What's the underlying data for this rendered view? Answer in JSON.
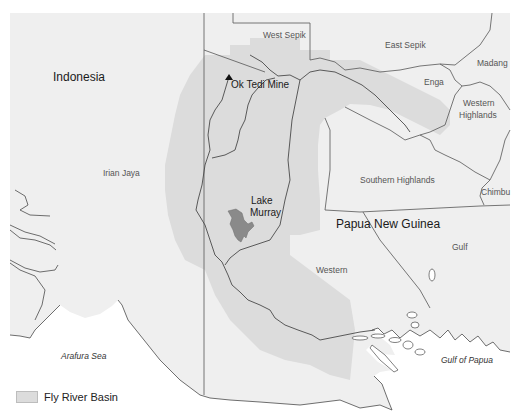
{
  "map": {
    "colors": {
      "land": "#efefef",
      "sea": "#ffffff",
      "basin": "#dcdcdc",
      "lake": "#8a8a8a",
      "border": "#555555",
      "river": "#4a4a4a"
    },
    "labels": {
      "indonesia": "Indonesia",
      "irian_jaya": "Irian Jaya",
      "west_sepik": "West Sepik",
      "east_sepik": "East Sepik",
      "madang": "Madang",
      "enga": "Enga",
      "western_highlands_1": "Western",
      "western_highlands_2": "Highlands",
      "southern_highlands": "Southern Highlands",
      "chimbu": "Chimbu",
      "papua_new_guinea": "Papua New Guinea",
      "gulf": "Gulf",
      "western": "Western",
      "ok_tedi_mine": "Ok Tedi Mine",
      "lake_murray_1": "Lake",
      "lake_murray_2": "Murray",
      "arafura_sea": "Arafura Sea",
      "gulf_of_papua": "Gulf of Papua"
    },
    "legend": {
      "items": [
        {
          "label": "Fly River Basin",
          "color": "#dcdcdc"
        }
      ]
    },
    "markers": [
      {
        "name": "Ok Tedi Mine",
        "symbol": "triangle"
      }
    ]
  }
}
